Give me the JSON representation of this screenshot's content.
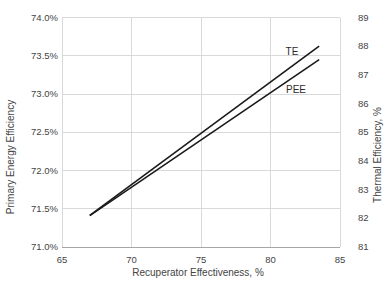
{
  "chart_data": {
    "type": "line",
    "title": "",
    "grid": true,
    "legend": "inline-labels",
    "x_axis": {
      "label": "Recuperator Effectiveness, %",
      "min": 65,
      "max": 85,
      "ticks": [
        65,
        70,
        75,
        80,
        85
      ]
    },
    "left_axis": {
      "label": "Primary Energy Efficiency",
      "min": 71.0,
      "max": 74.0,
      "ticks": [
        {
          "v": 74.0,
          "label": "74.0%"
        },
        {
          "v": 73.5,
          "label": "73.5%"
        },
        {
          "v": 73.0,
          "label": "73.0%"
        },
        {
          "v": 72.5,
          "label": "72.5%"
        },
        {
          "v": 72.0,
          "label": "72.0%"
        },
        {
          "v": 71.5,
          "label": "71.5%"
        },
        {
          "v": 71.0,
          "label": "71.0%"
        }
      ]
    },
    "right_axis": {
      "label": "Thermal Efficiency, %",
      "min": 81,
      "max": 89,
      "ticks": [
        {
          "v": 89,
          "label": "89"
        },
        {
          "v": 88,
          "label": "88"
        },
        {
          "v": 87,
          "label": "87"
        },
        {
          "v": 86,
          "label": "86"
        },
        {
          "v": 85,
          "label": "85"
        },
        {
          "v": 84,
          "label": "84"
        },
        {
          "v": 83,
          "label": "83"
        },
        {
          "v": 82,
          "label": "82"
        },
        {
          "v": 81,
          "label": "81"
        }
      ]
    },
    "series": [
      {
        "name": "TE",
        "axis": "right",
        "color": "#1a1a1a",
        "points": [
          [
            67,
            82.1
          ],
          [
            83.5,
            88.0
          ]
        ]
      },
      {
        "name": "PEE",
        "axis": "left",
        "color": "#1a1a1a",
        "points": [
          [
            67,
            71.41
          ],
          [
            83.5,
            73.45
          ]
        ]
      }
    ]
  },
  "colors": {
    "background": "#ffffff",
    "grid": "#d9d9d9",
    "axis_line": "#a6a6a6",
    "text": "#444444",
    "series_line": "#1a1a1a"
  }
}
